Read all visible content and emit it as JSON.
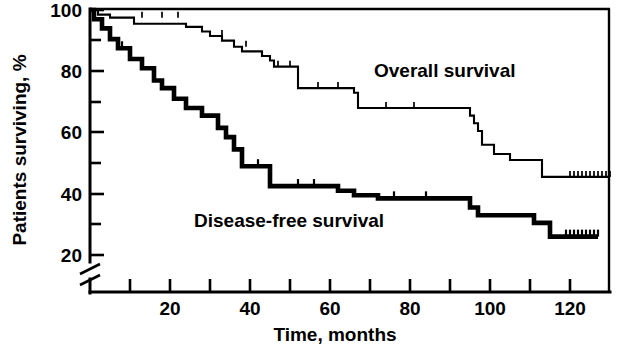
{
  "chart_data": {
    "type": "line",
    "subtype": "kaplan-meier-step",
    "title": "",
    "xlabel": "Time, months",
    "ylabel": "Patients surviving, %",
    "xlim": [
      0,
      130
    ],
    "ylim": [
      18,
      100
    ],
    "grid": false,
    "legend_position": "inline-annotation",
    "y_axis_break": true,
    "y_axis_break_note": "axis break drawn below the 20 tick",
    "xticks_major": [
      20,
      40,
      60,
      80,
      100,
      120
    ],
    "xticks_minor": [
      10,
      30,
      50,
      70,
      90,
      110
    ],
    "xtick_labels": [
      "20",
      "40",
      "60",
      "80",
      "100",
      "120"
    ],
    "yticks_major": [
      20,
      40,
      60,
      80,
      100
    ],
    "yticks_minor": [
      30,
      50,
      70,
      90
    ],
    "ytick_labels": [
      "20",
      "40",
      "60",
      "80",
      "100"
    ],
    "series": [
      {
        "name": "Overall survival",
        "label": "Overall survival",
        "line_weight": "thin",
        "label_x": 71,
        "label_y": 78,
        "steps": [
          [
            0,
            100
          ],
          [
            2,
            100
          ],
          [
            2,
            98.5
          ],
          [
            5,
            98.5
          ],
          [
            5,
            97.5
          ],
          [
            11,
            97.5
          ],
          [
            11,
            95.5
          ],
          [
            24,
            95.5
          ],
          [
            24,
            94.5
          ],
          [
            28,
            94.5
          ],
          [
            28,
            93.0
          ],
          [
            30,
            93.0
          ],
          [
            30,
            91.5
          ],
          [
            33,
            91.5
          ],
          [
            33,
            90.0
          ],
          [
            36,
            90.0
          ],
          [
            36,
            88.0
          ],
          [
            38,
            88.0
          ],
          [
            38,
            86.5
          ],
          [
            43,
            86.5
          ],
          [
            43,
            85.0
          ],
          [
            45,
            85.0
          ],
          [
            45,
            83.5
          ],
          [
            46,
            83.5
          ],
          [
            46,
            81.5
          ],
          [
            52,
            81.5
          ],
          [
            52,
            74.5
          ],
          [
            66,
            74.5
          ],
          [
            66,
            73.0
          ],
          [
            67,
            73.0
          ],
          [
            67,
            68.0
          ],
          [
            95,
            68.0
          ],
          [
            95,
            65.5
          ],
          [
            96,
            65.5
          ],
          [
            96,
            63.0
          ],
          [
            97,
            63.0
          ],
          [
            97,
            60.5
          ],
          [
            98,
            60.5
          ],
          [
            98,
            56.0
          ],
          [
            101,
            56.0
          ],
          [
            101,
            53.0
          ],
          [
            105,
            53.0
          ],
          [
            105,
            51.0
          ],
          [
            113,
            51.0
          ],
          [
            113,
            45.5
          ],
          [
            130,
            45.5
          ]
        ],
        "censor_marks": [
          [
            13,
            97.5
          ],
          [
            18,
            97.5
          ],
          [
            22,
            97.5
          ],
          [
            33,
            91.5
          ],
          [
            39,
            88.0
          ],
          [
            47,
            81.5
          ],
          [
            50,
            81.5
          ],
          [
            57,
            74.5
          ],
          [
            62,
            74.5
          ],
          [
            74,
            68.0
          ],
          [
            81,
            68.0
          ],
          [
            120,
            45.5
          ],
          [
            121,
            45.5
          ],
          [
            122,
            45.5
          ],
          [
            123,
            45.5
          ],
          [
            124,
            45.5
          ],
          [
            125,
            45.5
          ],
          [
            126,
            45.5
          ],
          [
            127,
            45.5
          ],
          [
            128,
            45.5
          ],
          [
            129,
            45.5
          ],
          [
            130,
            45.5
          ]
        ]
      },
      {
        "name": "Disease-free survival",
        "label": "Disease-free survival",
        "line_weight": "thick",
        "label_x": 26,
        "label_y": 29,
        "steps": [
          [
            0,
            100
          ],
          [
            1,
            100
          ],
          [
            1,
            97.0
          ],
          [
            3,
            97.0
          ],
          [
            3,
            94.0
          ],
          [
            5,
            94.0
          ],
          [
            5,
            90.5
          ],
          [
            7,
            90.5
          ],
          [
            7,
            87.5
          ],
          [
            10,
            87.5
          ],
          [
            10,
            84.0
          ],
          [
            13,
            84.0
          ],
          [
            13,
            81.0
          ],
          [
            16,
            81.0
          ],
          [
            16,
            77.0
          ],
          [
            18,
            77.0
          ],
          [
            18,
            74.5
          ],
          [
            21,
            74.5
          ],
          [
            21,
            71.0
          ],
          [
            24,
            71.0
          ],
          [
            24,
            68.0
          ],
          [
            28,
            68.0
          ],
          [
            28,
            65.5
          ],
          [
            32,
            65.5
          ],
          [
            32,
            61.5
          ],
          [
            34,
            61.5
          ],
          [
            34,
            58.5
          ],
          [
            36,
            58.5
          ],
          [
            36,
            54.5
          ],
          [
            38,
            54.5
          ],
          [
            38,
            49.0
          ],
          [
            45,
            49.0
          ],
          [
            45,
            42.5
          ],
          [
            62,
            42.5
          ],
          [
            62,
            41.0
          ],
          [
            66,
            41.0
          ],
          [
            66,
            39.5
          ],
          [
            72,
            39.5
          ],
          [
            72,
            38.5
          ],
          [
            95,
            38.5
          ],
          [
            95,
            35.5
          ],
          [
            97,
            35.5
          ],
          [
            97,
            33.0
          ],
          [
            111,
            33.0
          ],
          [
            111,
            30.5
          ],
          [
            115,
            30.5
          ],
          [
            115,
            26.0
          ],
          [
            127,
            26.0
          ]
        ],
        "censor_marks": [
          [
            8,
            87.5
          ],
          [
            42,
            49.0
          ],
          [
            52,
            42.5
          ],
          [
            56,
            42.5
          ],
          [
            76,
            38.5
          ],
          [
            84,
            38.5
          ],
          [
            119,
            26.0
          ],
          [
            120,
            26.0
          ],
          [
            121,
            26.0
          ],
          [
            122,
            26.0
          ],
          [
            123,
            26.0
          ],
          [
            124,
            26.0
          ],
          [
            125,
            26.0
          ],
          [
            126,
            26.0
          ],
          [
            127,
            26.0
          ]
        ]
      }
    ]
  },
  "axes": {
    "x_title": "Time, months",
    "y_title": "Patients surviving, %"
  }
}
